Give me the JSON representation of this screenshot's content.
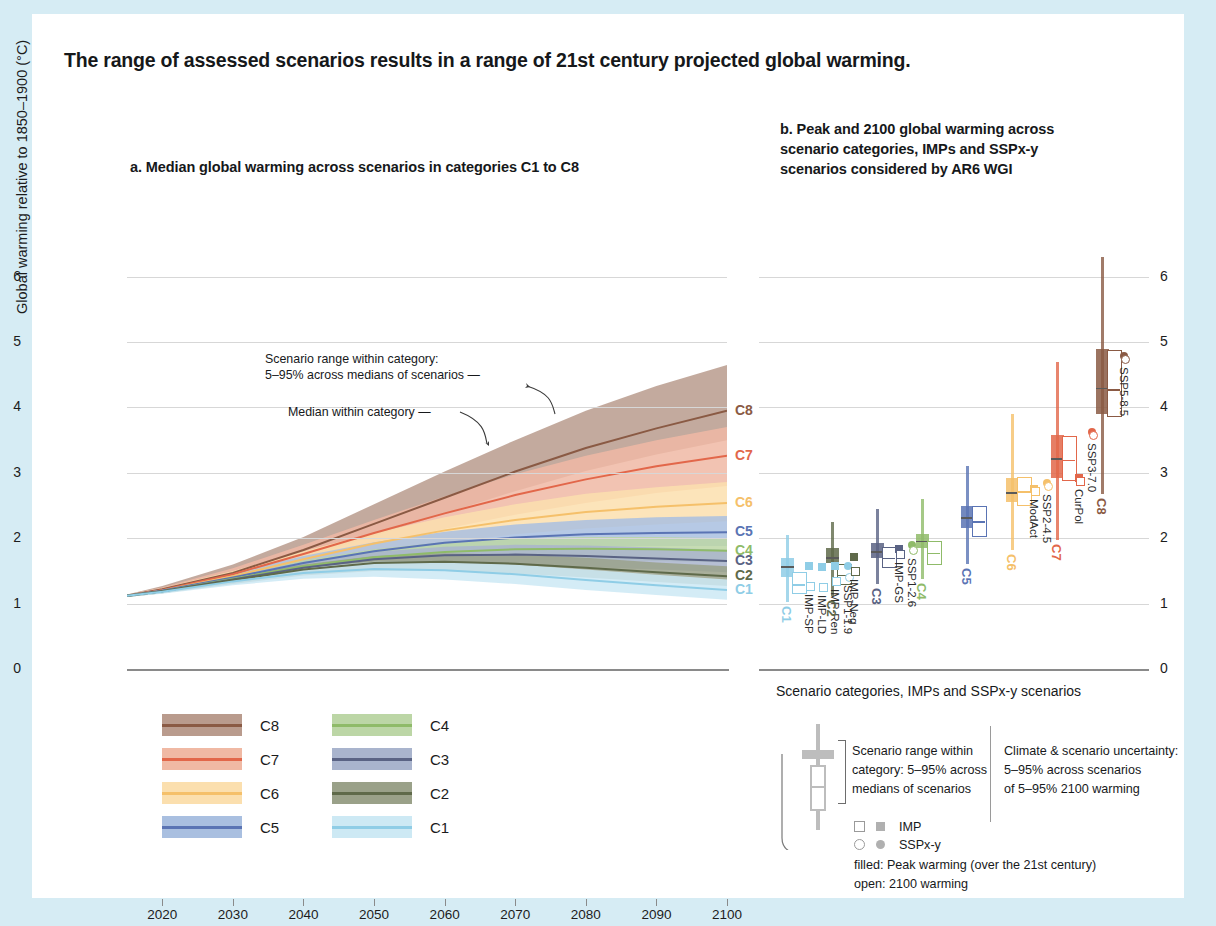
{
  "figure": {
    "title": "The range of assessed scenarios results in a range of 21st century projected global warming.",
    "background_color": "#d6ecf4",
    "card_color": "#ffffff"
  },
  "panel_a": {
    "title": "a. Median global warming across scenarios in categories C1 to C8",
    "ylabel": "Global warming relative to 1850–1900 (°C)",
    "yticks": [
      "0",
      "1",
      "2",
      "3",
      "4",
      "5",
      "6"
    ],
    "xticks": [
      "2020",
      "2030",
      "2040",
      "2050",
      "2060",
      "2070",
      "2080",
      "2090",
      "2100"
    ],
    "annotation_range": "Scenario range within category:\n5–95% across medians of scenarios",
    "annotation_range_l1": "Scenario range within category:",
    "annotation_range_l2": "5–95% across medians of scenarios —",
    "annotation_median": "Median within category —",
    "edge_labels": [
      "C8",
      "C7",
      "C6",
      "C5",
      "C4",
      "C3",
      "C2",
      "C1"
    ]
  },
  "panel_b": {
    "title": "b. Peak and 2100 global warming across scenario categories, IMPs and SSPx-y scenarios considered by AR6 WGI",
    "title_l1": "b. Peak and 2100 global warming across",
    "title_l2": "scenario categories, IMPs and SSPx-y",
    "title_l3": "scenarios considered by AR6 WGI",
    "xlabel": "Scenario categories, IMPs and SSPx-y scenarios",
    "yticks": [
      "0",
      "1",
      "2",
      "3",
      "4",
      "5",
      "6"
    ]
  },
  "legend_a": {
    "items": [
      {
        "label": "C8",
        "band": "#b99b8d",
        "line": "#8a5a44"
      },
      {
        "label": "C7",
        "band": "#f0b9a4",
        "line": "#e2674a"
      },
      {
        "label": "C6",
        "band": "#fbdfae",
        "line": "#f5c06a"
      },
      {
        "label": "C5",
        "band": "#a9bfe0",
        "line": "#5a74b4"
      },
      {
        "label": "C4",
        "band": "#bcd6a6",
        "line": "#8fbb69"
      },
      {
        "label": "C3",
        "band": "#a9b4cd",
        "line": "#5a6384"
      },
      {
        "label": "C2",
        "band": "#9aa189",
        "line": "#5f6a4a"
      },
      {
        "label": "C1",
        "band": "#cde9f4",
        "line": "#8fcde6"
      }
    ]
  },
  "legend_b": {
    "range_text_l1": "Scenario range within",
    "range_text_l2": "category: 5–95% across",
    "range_text_l3": "medians of scenarios",
    "uncert_text_l1": "Climate & scenario uncertainty:",
    "uncert_text_l2": "5–95% across scenarios",
    "uncert_text_l3": "of 5–95% 2100 warming",
    "marker_imp": "IMP",
    "marker_sspxy": "SSPx-y",
    "filled_note": "filled: Peak warming (over the 21st century)",
    "open_note": "open: 2100 warming"
  },
  "chart_data": [
    {
      "type": "area",
      "title": "a. Median global warming across scenarios in categories C1 to C8",
      "xlabel": "",
      "ylabel": "Global warming relative to 1850–1900 (°C)",
      "xlim": [
        2015,
        2100
      ],
      "ylim": [
        0,
        6.5
      ],
      "grid": true,
      "x": [
        2015,
        2020,
        2030,
        2040,
        2050,
        2060,
        2070,
        2080,
        2090,
        2100
      ],
      "series": [
        {
          "name": "C8",
          "color": "#8a5a44",
          "band": "#b99b8d",
          "median": [
            1.12,
            1.22,
            1.47,
            1.82,
            2.22,
            2.62,
            3.02,
            3.38,
            3.68,
            3.95
          ],
          "lower": [
            1.1,
            1.19,
            1.4,
            1.7,
            2.03,
            2.38,
            2.72,
            3.03,
            3.28,
            3.5
          ],
          "upper": [
            1.14,
            1.27,
            1.6,
            2.02,
            2.52,
            3.02,
            3.5,
            3.95,
            4.33,
            4.65
          ]
        },
        {
          "name": "C7",
          "color": "#e2674a",
          "band": "#f0b9a4",
          "median": [
            1.12,
            1.21,
            1.45,
            1.76,
            2.08,
            2.38,
            2.66,
            2.9,
            3.1,
            3.26
          ],
          "lower": [
            1.1,
            1.18,
            1.38,
            1.63,
            1.9,
            2.14,
            2.36,
            2.54,
            2.69,
            2.8
          ],
          "upper": [
            1.14,
            1.25,
            1.54,
            1.9,
            2.28,
            2.64,
            2.98,
            3.26,
            3.5,
            3.7
          ]
        },
        {
          "name": "C6",
          "color": "#f5c06a",
          "band": "#fbdfae",
          "median": [
            1.12,
            1.2,
            1.42,
            1.68,
            1.92,
            2.12,
            2.28,
            2.4,
            2.48,
            2.54
          ],
          "lower": [
            1.1,
            1.17,
            1.36,
            1.58,
            1.78,
            1.94,
            2.06,
            2.15,
            2.21,
            2.26
          ],
          "upper": [
            1.14,
            1.24,
            1.5,
            1.8,
            2.08,
            2.32,
            2.52,
            2.68,
            2.78,
            2.86
          ]
        },
        {
          "name": "C5",
          "color": "#5a74b4",
          "band": "#a9bfe0",
          "median": [
            1.12,
            1.2,
            1.4,
            1.62,
            1.8,
            1.93,
            2.01,
            2.06,
            2.08,
            2.09
          ],
          "lower": [
            1.1,
            1.17,
            1.34,
            1.53,
            1.68,
            1.78,
            1.84,
            1.87,
            1.88,
            1.88
          ],
          "upper": [
            1.14,
            1.23,
            1.47,
            1.73,
            1.94,
            2.1,
            2.21,
            2.28,
            2.32,
            2.34
          ]
        },
        {
          "name": "C4",
          "color": "#8fbb69",
          "band": "#bcd6a6",
          "median": [
            1.12,
            1.19,
            1.38,
            1.57,
            1.71,
            1.79,
            1.83,
            1.84,
            1.83,
            1.81
          ],
          "lower": [
            1.1,
            1.16,
            1.32,
            1.48,
            1.59,
            1.65,
            1.67,
            1.67,
            1.65,
            1.63
          ],
          "upper": [
            1.14,
            1.22,
            1.44,
            1.66,
            1.83,
            1.94,
            2.0,
            2.02,
            2.02,
            2.0
          ]
        },
        {
          "name": "C3",
          "color": "#5a6384",
          "band": "#a9b4cd",
          "median": [
            1.12,
            1.19,
            1.37,
            1.55,
            1.68,
            1.74,
            1.75,
            1.73,
            1.69,
            1.65
          ],
          "lower": [
            1.1,
            1.16,
            1.31,
            1.46,
            1.56,
            1.6,
            1.59,
            1.56,
            1.52,
            1.48
          ],
          "upper": [
            1.14,
            1.22,
            1.43,
            1.64,
            1.79,
            1.87,
            1.9,
            1.89,
            1.86,
            1.82
          ]
        },
        {
          "name": "C2",
          "color": "#5f6a4a",
          "band": "#9aa189",
          "median": [
            1.12,
            1.19,
            1.36,
            1.52,
            1.62,
            1.64,
            1.61,
            1.55,
            1.48,
            1.42
          ],
          "lower": [
            1.1,
            1.16,
            1.3,
            1.43,
            1.5,
            1.5,
            1.46,
            1.4,
            1.33,
            1.27
          ],
          "upper": [
            1.14,
            1.22,
            1.42,
            1.6,
            1.73,
            1.77,
            1.75,
            1.7,
            1.63,
            1.57
          ]
        },
        {
          "name": "C1",
          "color": "#8fcde6",
          "band": "#cde9f4",
          "median": [
            1.12,
            1.18,
            1.34,
            1.47,
            1.53,
            1.51,
            1.45,
            1.36,
            1.28,
            1.21
          ],
          "lower": [
            1.1,
            1.15,
            1.28,
            1.38,
            1.41,
            1.37,
            1.3,
            1.21,
            1.13,
            1.06
          ],
          "upper": [
            1.14,
            1.21,
            1.4,
            1.55,
            1.64,
            1.64,
            1.6,
            1.52,
            1.44,
            1.37
          ]
        }
      ]
    },
    {
      "type": "box",
      "title": "b. Peak and 2100 global warming across scenario categories, IMPs and SSPx-y scenarios considered by AR6 WGI",
      "xlabel": "Scenario categories, IMPs and SSPx-y scenarios",
      "ylabel": "Global warming relative to 1850–1900 (°C)",
      "ylim": [
        0,
        6.5
      ],
      "grid": true,
      "boxes": [
        {
          "name": "C1",
          "color": "#8fcde6",
          "peak": {
            "whisk_low": 1.22,
            "q1": 1.41,
            "median": 1.57,
            "q3": 1.7,
            "whisk_high": 2.05
          },
          "y2100": {
            "whisk_low": 1.02,
            "q1": 1.17,
            "median": 1.3,
            "q3": 1.49,
            "whisk_high": 1.72
          }
        },
        {
          "name": "C2",
          "color": "#5f6a4a",
          "peak": {
            "whisk_low": 1.42,
            "q1": 1.62,
            "median": 1.71,
            "q3": 1.85,
            "whisk_high": 2.25
          },
          "y2100": {
            "whisk_low": 1.12,
            "q1": 1.31,
            "median": 1.44,
            "q3": 1.6,
            "whisk_high": 1.9
          }
        },
        {
          "name": "C3",
          "color": "#5a6384",
          "peak": {
            "whisk_low": 1.48,
            "q1": 1.7,
            "median": 1.8,
            "q3": 1.92,
            "whisk_high": 2.45
          },
          "y2100": {
            "whisk_low": 1.3,
            "q1": 1.58,
            "median": 1.7,
            "q3": 1.86,
            "whisk_high": 2.12
          }
        },
        {
          "name": "C4",
          "color": "#8fbb69",
          "peak": {
            "whisk_low": 1.55,
            "q1": 1.85,
            "median": 1.96,
            "q3": 2.06,
            "whisk_high": 2.6
          },
          "y2100": {
            "whisk_low": 1.38,
            "q1": 1.62,
            "median": 1.78,
            "q3": 1.96,
            "whisk_high": 2.25
          }
        },
        {
          "name": "C5",
          "color": "#5a74b4",
          "peak": {
            "whisk_low": 1.7,
            "q1": 2.16,
            "median": 2.32,
            "q3": 2.5,
            "whisk_high": 3.1
          },
          "y2100": {
            "whisk_low": 1.6,
            "q1": 2.05,
            "median": 2.26,
            "q3": 2.5,
            "whisk_high": 3.05
          }
        },
        {
          "name": "C6",
          "color": "#f5c06a",
          "peak": {
            "whisk_low": 1.85,
            "q1": 2.55,
            "median": 2.7,
            "q3": 2.92,
            "whisk_high": 3.9
          },
          "y2100": {
            "whisk_low": 1.82,
            "q1": 2.53,
            "median": 2.72,
            "q3": 2.94,
            "whisk_high": 3.88
          }
        },
        {
          "name": "C7",
          "color": "#e2674a",
          "peak": {
            "whisk_low": 2.0,
            "q1": 2.92,
            "median": 3.22,
            "q3": 3.58,
            "whisk_high": 4.7
          },
          "y2100": {
            "whisk_low": 1.98,
            "q1": 2.9,
            "median": 3.2,
            "q3": 3.56,
            "whisk_high": 4.68
          }
        },
        {
          "name": "C8",
          "color": "#8a5a44",
          "peak": {
            "whisk_low": 2.7,
            "q1": 3.9,
            "median": 4.3,
            "q3": 4.9,
            "whisk_high": 6.3
          },
          "y2100": {
            "whisk_low": 2.68,
            "q1": 3.88,
            "median": 4.28,
            "q3": 4.88,
            "whisk_high": 6.28
          }
        }
      ],
      "markers": [
        {
          "name": "IMP-SP",
          "group": "C1",
          "shape": "square",
          "color": "#8fcde6",
          "peak": 1.58,
          "y2100": 1.27
        },
        {
          "name": "IMP-LD",
          "group": "C1",
          "shape": "square",
          "color": "#8fcde6",
          "peak": 1.56,
          "y2100": 1.25
        },
        {
          "name": "IMP-Ren",
          "group": "C1",
          "shape": "square",
          "color": "#8fcde6",
          "peak": 1.58,
          "y2100": 1.35
        },
        {
          "name": "SSP1-1.9",
          "group": "C1",
          "shape": "circle",
          "color": "#8fcde6",
          "peak": 1.58,
          "y2100": 1.4
        },
        {
          "name": "IMP-Neg",
          "group": "C2",
          "shape": "square",
          "color": "#5f6a4a",
          "peak": 1.71,
          "y2100": 1.5
        },
        {
          "name": "IMP-GS",
          "group": "C3",
          "shape": "square",
          "color": "#5a6384",
          "peak": 1.84,
          "y2100": 1.76
        },
        {
          "name": "SSP1-2.6",
          "group": "C3",
          "shape": "circle",
          "color": "#8fbb69",
          "peak": 1.9,
          "y2100": 1.82
        },
        {
          "name": "ModAct",
          "group": "C6",
          "shape": "square",
          "color": "#f5c06a",
          "peak": 2.75,
          "y2100": 2.72
        },
        {
          "name": "SSP2-4.5",
          "group": "C6",
          "shape": "circle",
          "color": "#f5c06a",
          "peak": 2.84,
          "y2100": 2.8
        },
        {
          "name": "CurPol",
          "group": "C7",
          "shape": "square",
          "color": "#e2674a",
          "peak": 2.92,
          "y2100": 2.88
        },
        {
          "name": "SSP3-7.0",
          "group": "C7",
          "shape": "circle",
          "color": "#e2674a",
          "peak": 3.62,
          "y2100": 3.58
        },
        {
          "name": "SSP5-8.5",
          "group": "C8",
          "shape": "circle",
          "color": "#8a5a44",
          "peak": 4.78,
          "y2100": 4.74
        }
      ]
    }
  ]
}
